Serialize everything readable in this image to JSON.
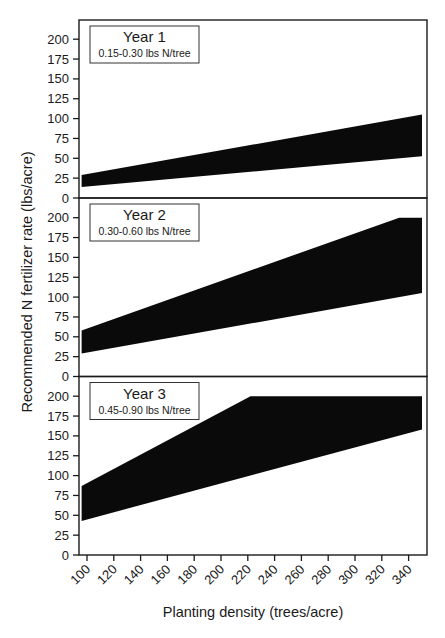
{
  "chart_data": {
    "type": "area",
    "ylabel": "Recommended N fertilizer rate (lbs/acre)",
    "xlabel": "Planting density (trees/acre)",
    "x_ticks": [
      100,
      120,
      140,
      160,
      180,
      200,
      220,
      240,
      260,
      280,
      300,
      320,
      340
    ],
    "y_ticks": [
      0,
      25,
      50,
      75,
      100,
      125,
      150,
      175,
      200
    ],
    "xlim": [
      94,
      354
    ],
    "ylim": [
      0,
      225
    ],
    "grid": false,
    "colors": {
      "band": "#0a0a0a",
      "axis": "#1a1a1a",
      "background": "#ffffff"
    },
    "panels": [
      {
        "title": "Year 1",
        "subtitle": "0.15-0.30 lbs N/tree",
        "x": [
          96,
          350
        ],
        "upper": [
          [
            96,
            29
          ],
          [
            350,
            105
          ]
        ],
        "lower": [
          [
            96,
            14
          ],
          [
            350,
            52.5
          ]
        ]
      },
      {
        "title": "Year 2",
        "subtitle": "0.30-0.60 lbs N/tree",
        "x": [
          96,
          350
        ],
        "upper": [
          [
            96,
            58
          ],
          [
            333,
            200
          ],
          [
            350,
            200
          ]
        ],
        "lower": [
          [
            96,
            29
          ],
          [
            350,
            105
          ]
        ]
      },
      {
        "title": "Year 3",
        "subtitle": "0.45-0.90 lbs N/tree",
        "x": [
          96,
          350
        ],
        "upper": [
          [
            96,
            87
          ],
          [
            222,
            200
          ],
          [
            350,
            200
          ]
        ],
        "lower": [
          [
            96,
            43
          ],
          [
            350,
            158
          ]
        ]
      }
    ]
  }
}
